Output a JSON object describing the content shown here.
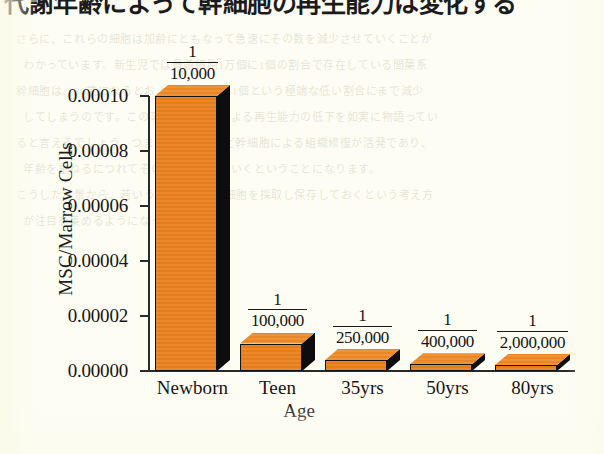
{
  "page": {
    "headline": "代謝年齢によって幹細胞の再生能力は変化する",
    "background_color": "#fdfdf4",
    "ghost_lines": [
      "さらに、これらの細胞は加齢にともなって急速にその数を減少させていくことが",
      "わかっています。新生児では骨髄細胞1万個に1個の割合で存在している間葉系",
      "幹細胞は、80歳になるとおよそ200万個に1個という極端な低い割合にまで減少",
      "してしまうのです。この事実は、加齢による再生能力の低下を如実に物語ってい",
      "ると言えるでしょう。つまり若い時期ほど幹細胞による組織修復が活発であり、",
      "年齢を重ねるにつれてその働きが衰えていくということになります。",
      "こうした背景から、若いうちに自己の幹細胞を採取し保存しておくという考え方",
      "が注目を集めるようになってきました。"
    ]
  },
  "chart_data": {
    "type": "bar",
    "title": "",
    "subtitle": "",
    "xlabel": "Age",
    "ylabel": "MSC/Marrow Cells",
    "categories": [
      "Newborn",
      "Teen",
      "35yrs",
      "50yrs",
      "80yrs"
    ],
    "values": [
      0.0001,
      1e-05,
      4e-06,
      2.5e-06,
      5e-07
    ],
    "point_labels": [
      {
        "numerator": "1",
        "denominator": "10,000"
      },
      {
        "numerator": "1",
        "denominator": "100,000"
      },
      {
        "numerator": "1",
        "denominator": "250,000"
      },
      {
        "numerator": "1",
        "denominator": "400,000"
      },
      {
        "numerator": "1",
        "denominator": "2,000,000"
      }
    ],
    "ylim": [
      0.0,
      0.0001
    ],
    "ytick_labels": [
      "0.00010",
      "0.00008",
      "0.00006",
      "0.00004",
      "0.00002",
      "0.00000"
    ],
    "ytick_values": [
      0.0001,
      8e-05,
      6e-05,
      4e-05,
      2e-05,
      0.0
    ],
    "grid": false,
    "legend": false,
    "legend_position": "none",
    "style": "3d-bar",
    "bar_face_color": "#ea8221",
    "bar_top_color": "#ee8a28",
    "bar_shadow_color": "#0d0d0d",
    "axis_color": "#2a2a2a",
    "text_color": "#151515"
  }
}
